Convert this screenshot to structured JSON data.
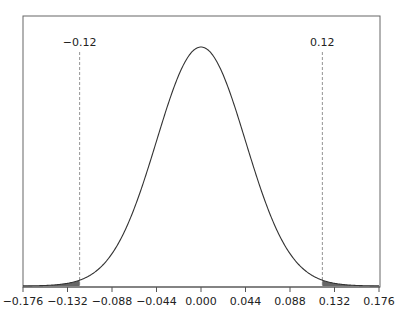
{
  "chart_data": {
    "type": "area",
    "title": "",
    "xlabel": "",
    "ylabel": "",
    "distribution": {
      "mean": 0.0,
      "sd": 0.044
    },
    "xlim": [
      -0.176,
      0.176
    ],
    "x_ticks": [
      -0.176,
      -0.132,
      -0.088,
      -0.044,
      0.0,
      0.044,
      0.088,
      0.132,
      0.176
    ],
    "x_tick_labels": [
      "−0.176",
      "−0.132",
      "−0.088",
      "−0.044",
      "0.000",
      "0.044",
      "0.088",
      "0.132",
      "0.176"
    ],
    "critical_values": [
      -0.12,
      0.12
    ],
    "critical_labels": [
      "−0.12",
      "0.12"
    ],
    "shaded_regions": [
      {
        "from": -0.176,
        "to": -0.12
      },
      {
        "from": 0.12,
        "to": 0.176
      }
    ],
    "grid": false,
    "legend": null,
    "colors": {
      "curve": "#333333",
      "shade": "#666666",
      "axis": "#555555",
      "dashed": "#777777"
    }
  }
}
